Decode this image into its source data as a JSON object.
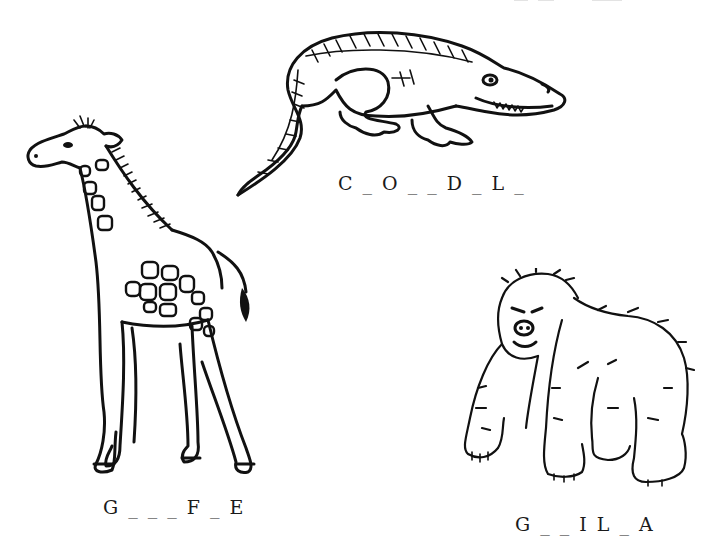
{
  "worksheet": {
    "items": [
      {
        "animal": "crocodile",
        "icon": "crocodile-drawing",
        "puzzle": "C _ O _ _ D _ L _"
      },
      {
        "animal": "giraffe",
        "icon": "giraffe-drawing",
        "puzzle": "G _ _ _ F _ E"
      },
      {
        "animal": "gorilla",
        "icon": "gorilla-drawing",
        "puzzle": "G _ _ I L _ A"
      }
    ]
  },
  "colors": {
    "ink": "#111111",
    "paper": "#ffffff"
  }
}
